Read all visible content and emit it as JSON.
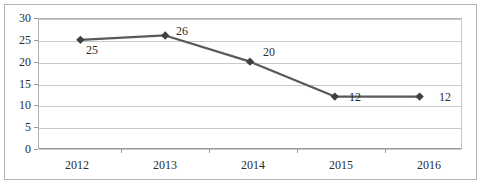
{
  "chart_data": {
    "type": "line",
    "title": "",
    "xlabel": "",
    "ylabel": "",
    "categories": [
      "2012",
      "2013",
      "2014",
      "2015",
      "2016"
    ],
    "values": [
      25,
      26,
      20,
      12,
      12
    ],
    "data_labels": [
      "25",
      "26",
      "20",
      "12",
      "12"
    ],
    "ylim": [
      0,
      30
    ],
    "yticks": [
      0,
      5,
      10,
      15,
      20,
      25,
      30
    ],
    "ytick_labels": [
      "0",
      "5",
      "10",
      "15",
      "20",
      "25",
      "30"
    ],
    "grid": true,
    "legend": "none",
    "series": [
      {
        "name": "",
        "values": [
          25,
          26,
          20,
          12,
          12
        ],
        "marker": "diamond",
        "line_color": "#595959",
        "marker_color": "#404040"
      }
    ]
  },
  "colors": {
    "line": "#595959",
    "marker": "#404040",
    "gridline": "#c9c9c9",
    "axis": "#9a9a9a",
    "frame": "#b4b4b4",
    "text": "#2b2b2b",
    "background": "#ffffff"
  }
}
